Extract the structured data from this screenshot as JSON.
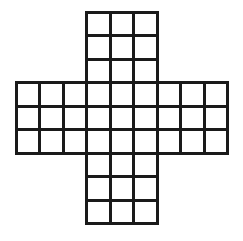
{
  "figure": {
    "shape_name": "plus-shaped polyomino grid",
    "background_color": "#ffffff",
    "line_color": "#1a1a1a",
    "cell_fill_color": "#ffffff",
    "stroke_width_px": 3,
    "grid": {
      "columns": 9,
      "rows": 9,
      "cell_size_px": 23.5,
      "origin_x_px": 16,
      "origin_y_px": 12,
      "total_cells_drawn": 45,
      "omitted_corner_blocks": 4,
      "omitted_block_size": 3
    },
    "arms": [
      {
        "name": "top-arm",
        "columns": 3,
        "rows": 3,
        "cells": 9
      },
      {
        "name": "left-arm",
        "columns": 3,
        "rows": 3,
        "cells": 9
      },
      {
        "name": "center-block",
        "columns": 3,
        "rows": 3,
        "cells": 9
      },
      {
        "name": "right-arm",
        "columns": 3,
        "rows": 3,
        "cells": 9
      },
      {
        "name": "bottom-arm",
        "columns": 3,
        "rows": 3,
        "cells": 9
      }
    ],
    "occupied_cells": [
      [
        3,
        0
      ],
      [
        4,
        0
      ],
      [
        5,
        0
      ],
      [
        3,
        1
      ],
      [
        4,
        1
      ],
      [
        5,
        1
      ],
      [
        3,
        2
      ],
      [
        4,
        2
      ],
      [
        5,
        2
      ],
      [
        0,
        3
      ],
      [
        1,
        3
      ],
      [
        2,
        3
      ],
      [
        3,
        3
      ],
      [
        4,
        3
      ],
      [
        5,
        3
      ],
      [
        6,
        3
      ],
      [
        7,
        3
      ],
      [
        8,
        3
      ],
      [
        0,
        4
      ],
      [
        1,
        4
      ],
      [
        2,
        4
      ],
      [
        3,
        4
      ],
      [
        4,
        4
      ],
      [
        5,
        4
      ],
      [
        6,
        4
      ],
      [
        7,
        4
      ],
      [
        8,
        4
      ],
      [
        0,
        5
      ],
      [
        1,
        5
      ],
      [
        2,
        5
      ],
      [
        3,
        5
      ],
      [
        4,
        5
      ],
      [
        5,
        5
      ],
      [
        6,
        5
      ],
      [
        7,
        5
      ],
      [
        8,
        5
      ],
      [
        3,
        6
      ],
      [
        4,
        6
      ],
      [
        5,
        6
      ],
      [
        3,
        7
      ],
      [
        4,
        7
      ],
      [
        5,
        7
      ],
      [
        3,
        8
      ],
      [
        4,
        8
      ],
      [
        5,
        8
      ]
    ]
  }
}
